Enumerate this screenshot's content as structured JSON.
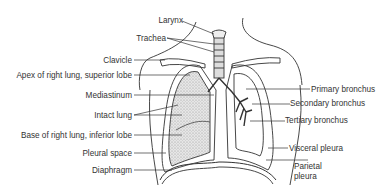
{
  "diagram": {
    "labels_left": [
      {
        "id": "larynx",
        "text": "Larynx"
      },
      {
        "id": "trachea",
        "text": "Trachea"
      },
      {
        "id": "clavicle",
        "text": "Clavicle"
      },
      {
        "id": "apex",
        "text": "Apex of right lung, superior lobe"
      },
      {
        "id": "mediastinum",
        "text": "Mediastinum"
      },
      {
        "id": "intact_lung",
        "text": "Intact lung"
      },
      {
        "id": "base",
        "text": "Base of right lung, inferior lobe"
      },
      {
        "id": "pleural_space",
        "text": "Pleural space"
      },
      {
        "id": "diaphragm",
        "text": "Diaphragm"
      }
    ],
    "labels_right": [
      {
        "id": "primary_bronchus",
        "text": "Primary bronchus"
      },
      {
        "id": "secondary_bronchus",
        "text": "Secondary bronchus"
      },
      {
        "id": "tertiary_bronchus",
        "text": "Tertiary bronchus"
      },
      {
        "id": "visceral_pleura",
        "text": "Visceral pleura"
      },
      {
        "id": "parietal_pleura_1",
        "text": "Parietal"
      },
      {
        "id": "parietal_pleura_2",
        "text": "pleura"
      }
    ]
  }
}
